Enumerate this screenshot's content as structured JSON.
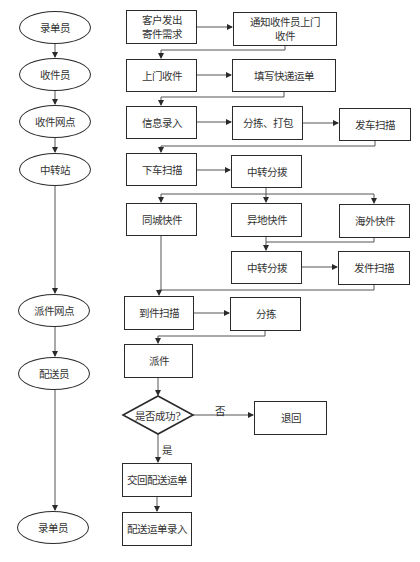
{
  "roles": [
    {
      "id": "r1",
      "label": "录单员"
    },
    {
      "id": "r2",
      "label": "收件员"
    },
    {
      "id": "r3",
      "label": "收件网点"
    },
    {
      "id": "r4",
      "label": "中转站"
    },
    {
      "id": "r5",
      "label": "派件网点"
    },
    {
      "id": "r6",
      "label": "配送员"
    },
    {
      "id": "r7",
      "label": "录单员"
    }
  ],
  "steps": {
    "customer_request": "客户发出寄件需求",
    "customer_request_line1": "客户发出",
    "customer_request_line2": "寄件需求",
    "notify_courier_line1": "通知收件员上门",
    "notify_courier_line2": "收件",
    "door_pickup": "上门收件",
    "fill_waybill": "填写快递运单",
    "info_entry": "信息录入",
    "sort_pack": "分拣、打包",
    "dispatch_scan": "发车扫描",
    "unload_scan": "下车扫描",
    "transfer_sort_1": "中转分拨",
    "same_city": "同城快件",
    "other_city": "异地快件",
    "overseas": "海外快件",
    "transfer_sort_2": "中转分拨",
    "send_scan": "发件扫描",
    "arrival_scan": "到件扫描",
    "sorting": "分拣",
    "delivery": "派件",
    "decision": "是否成功?",
    "return": "退回",
    "hand_back_waybill": "交回配送运单",
    "waybill_entry": "配送运单录入"
  },
  "edge_labels": {
    "yes": "是",
    "no": "否"
  },
  "colors": {
    "stroke": "#2a2a2a",
    "text": "#333333",
    "background": "#ffffff"
  }
}
